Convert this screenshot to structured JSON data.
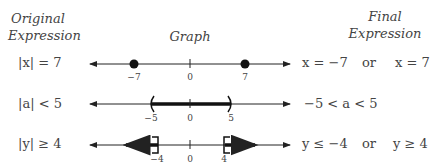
{
  "headers": {
    "original": "Original",
    "original2": "Expression",
    "graph": "Graph",
    "final": "Final",
    "final2": "Expression"
  },
  "rows": [
    {
      "expression": "|x| = 7",
      "ticks": [
        "−7",
        "0",
        "7"
      ],
      "final_left": "x = −7",
      "connector": "or",
      "final_right": "x = 7"
    },
    {
      "expression": "|a| < 5",
      "ticks": [
        "−5",
        "0",
        "5"
      ],
      "final_left": "−5 < a < 5",
      "connector": "",
      "final_right": ""
    },
    {
      "expression": "|y| ≥ 4",
      "ticks": [
        "−4",
        "0",
        "4"
      ],
      "final_left": "y ≤ −4",
      "connector": "or",
      "final_right": "y ≥ 4"
    }
  ]
}
